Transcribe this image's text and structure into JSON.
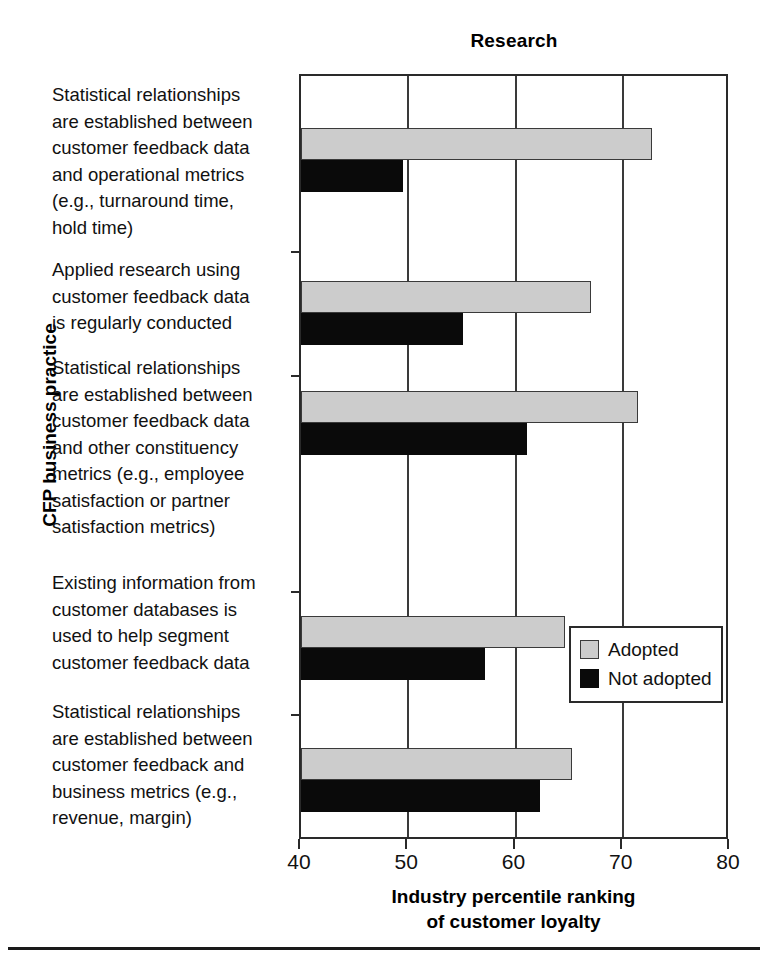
{
  "chart_data": {
    "type": "bar",
    "orientation": "horizontal",
    "title": "Research",
    "xlabel": "Industry percentile ranking\nof customer loyalty",
    "xlabel_line1": "Industry percentile ranking",
    "xlabel_line2": "of customer loyalty",
    "ylabel": "CFP business practice",
    "xlim": [
      40,
      80
    ],
    "xticks": [
      40,
      50,
      60,
      70,
      80
    ],
    "xtick_labels": [
      "40",
      "50",
      "60",
      "70",
      "80"
    ],
    "grid": true,
    "grid_axis": "x",
    "legend_position": "center right",
    "categories": [
      "Statistical relationships are established between customer feedback data and operational metrics (e.g., turnaround time, hold time)",
      "Applied research using customer feedback data is regularly conducted",
      "Statistical relationships are established between customer feedback data and other constituency metrics (e.g., employee satisfaction or partner satisfaction metrics)",
      "Existing information from customer databases is used to help segment customer feedback data",
      "Statistical relationships are established between customer feedback and business metrics (e.g., revenue, margin)"
    ],
    "category_lines": [
      [
        "Statistical relationships",
        "are established between",
        "customer feedback data",
        "and operational metrics",
        "(e.g., turnaround time,",
        "hold time)"
      ],
      [
        "Applied research using",
        "customer feedback data",
        "is regularly conducted"
      ],
      [
        "Statistical relationships",
        "are established between",
        "customer feedback data",
        "and other constituency",
        "metrics (e.g., employee",
        "satisfaction or partner",
        "satisfaction metrics)"
      ],
      [
        "Existing information from",
        "customer databases is",
        "used to help segment",
        "customer feedback data"
      ],
      [
        "Statistical relationships",
        "are established between",
        "customer feedback and",
        "business metrics (e.g.,",
        "revenue, margin)"
      ]
    ],
    "series": [
      {
        "name": "Adopted",
        "color": "#cccccc",
        "values": [
          72.7,
          67.0,
          71.4,
          64.6,
          65.3
        ]
      },
      {
        "name": "Not adopted",
        "color": "#0a0a0a",
        "values": [
          49.5,
          55.1,
          61.1,
          57.2,
          62.3
        ]
      }
    ]
  },
  "legend": {
    "items": [
      {
        "label": "Adopted",
        "swatch": "adopted"
      },
      {
        "label": "Not adopted",
        "swatch": "not-adopted"
      }
    ]
  }
}
